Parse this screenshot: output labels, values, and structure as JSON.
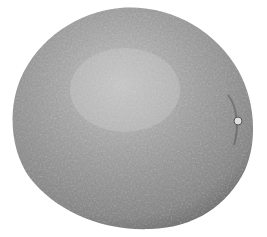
{
  "image": {
    "subject": "orange fruit (grayscale photo)",
    "background_color": "#ffffff",
    "fruit_colors": {
      "highlight": "#c4c4c4",
      "mid": "#9a9a9a",
      "shadow": "#6e6e6e",
      "edge": "#5a5a5a"
    }
  }
}
